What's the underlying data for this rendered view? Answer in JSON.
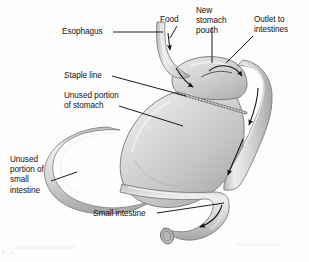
{
  "figure": {
    "background_color": "#fdfdfd",
    "width": 309,
    "height": 262
  },
  "labels": {
    "esophagus": "Esophagus",
    "food": "Food",
    "new_stomach_pouch": "New\nstomach\npouch",
    "outlet_to_intestines": "Outlet to\nintestines",
    "staple_line": "Staple line",
    "unused_portion_of_stomach": "Unused portion\nof stomach",
    "unused_portion_of_small_intestine": "Unused\nportion of\nsmall\nintestine",
    "small_intestine": "Small intestine"
  },
  "colors": {
    "organ_light": "#e2e2e2",
    "organ_mid": "#c9c9c9",
    "organ_dark": "#a9a9a9",
    "outline": "#6e6e6e",
    "leader_line": "#101010",
    "text": "#121212",
    "staple": "#8d8d8d",
    "background": "#fdfdfd"
  },
  "anatomy": {
    "parts": [
      "esophagus",
      "new-stomach-pouch",
      "staple-line",
      "unused-stomach",
      "roux-limb",
      "unused-small-intestine-loop",
      "small-intestine",
      "intestine-cut-end"
    ],
    "flow_arrows": [
      "esophagus-downward",
      "pouch-inflow",
      "pouch-to-outlet",
      "outlet-downward",
      "roux-limb-downward",
      "roux-limb-lower-downward",
      "distal-bowel-leftward"
    ]
  }
}
